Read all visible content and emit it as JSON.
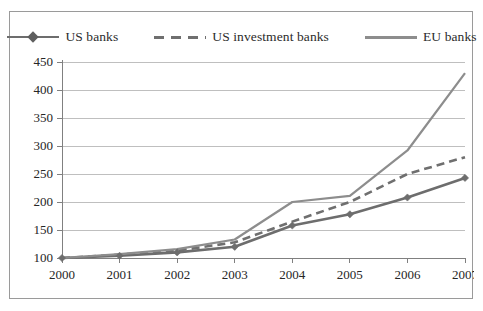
{
  "top_clipped_text": "",
  "legend": {
    "position": "top-center",
    "items": [
      {
        "label": "US banks",
        "key": "line-marker-diamond-icon",
        "style": "solid",
        "color": "#6d6d6d"
      },
      {
        "label": "US investment banks",
        "key": "line-dashed-icon",
        "style": "dashed",
        "color": "#6f6f6f"
      },
      {
        "label": "EU banks",
        "key": "line-solid-icon",
        "style": "solid",
        "color": "#8d8d8d"
      }
    ]
  },
  "chart_data": {
    "type": "line",
    "title": "",
    "subtitle": "",
    "xlabel": "",
    "ylabel": "",
    "x": [
      "2000",
      "2001",
      "2002",
      "2003",
      "2004",
      "2005",
      "2006",
      "2007"
    ],
    "categories": [
      "2000",
      "2001",
      "2002",
      "2003",
      "2004",
      "2005",
      "2006",
      "2007"
    ],
    "series": [
      {
        "name": "US banks",
        "values": [
          100,
          104,
          110,
          120,
          158,
          178,
          208,
          243
        ],
        "style": "solid",
        "marker": "diamond",
        "color": "#6d6d6d"
      },
      {
        "name": "US investment banks",
        "values": [
          100,
          106,
          113,
          128,
          165,
          200,
          250,
          280
        ],
        "style": "dashed",
        "marker": "none",
        "color": "#6f6f6f"
      },
      {
        "name": "EU banks",
        "values": [
          100,
          107,
          116,
          133,
          200,
          211,
          292,
          430
        ],
        "style": "solid",
        "marker": "none",
        "color": "#8d8d8d"
      }
    ],
    "ylim": [
      100,
      450
    ],
    "yticks": [
      100,
      150,
      200,
      250,
      300,
      350,
      400,
      450
    ],
    "ytick_labels": [
      "100",
      "150",
      "200",
      "250",
      "300",
      "350",
      "400",
      "450"
    ],
    "xtick_labels": [
      "2000",
      "2001",
      "2002",
      "2003",
      "2004",
      "2005",
      "2006",
      "2007"
    ],
    "grid": "horizontal",
    "grid_color": "#bfbfbf",
    "axis_color": "#808080",
    "plot_background": "#ffffff",
    "border_color": "#9a9a9a",
    "legend_position": "top-center"
  }
}
